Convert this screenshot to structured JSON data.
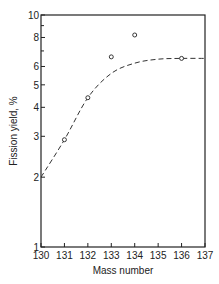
{
  "chart_data": {
    "type": "scatter",
    "title": "",
    "xlabel": "Mass number",
    "ylabel": "Fission yield, %",
    "xlim": [
      130,
      137
    ],
    "ylim": [
      1,
      10
    ],
    "yscale": "log",
    "grid": false,
    "legend": null,
    "x_ticks": [
      "130",
      "131",
      "132",
      "133",
      "134",
      "135",
      "136",
      "137"
    ],
    "y_ticks": [
      "1",
      "2",
      "3",
      "4",
      "5",
      "6",
      "8",
      "10"
    ],
    "series": [
      {
        "name": "measured",
        "style": "open-circles",
        "points": [
          {
            "x": 131,
            "y": 2.9
          },
          {
            "x": 132,
            "y": 4.4
          },
          {
            "x": 133,
            "y": 6.6
          },
          {
            "x": 134,
            "y": 8.2
          },
          {
            "x": 136,
            "y": 6.5
          }
        ]
      },
      {
        "name": "fitted curve",
        "style": "dashed-line",
        "points": [
          {
            "x": 130,
            "y": 2.0
          },
          {
            "x": 131,
            "y": 2.9
          },
          {
            "x": 132,
            "y": 4.4
          },
          {
            "x": 133,
            "y": 5.6
          },
          {
            "x": 134,
            "y": 6.2
          },
          {
            "x": 135,
            "y": 6.45
          },
          {
            "x": 136,
            "y": 6.5
          },
          {
            "x": 137,
            "y": 6.5
          }
        ]
      }
    ]
  }
}
